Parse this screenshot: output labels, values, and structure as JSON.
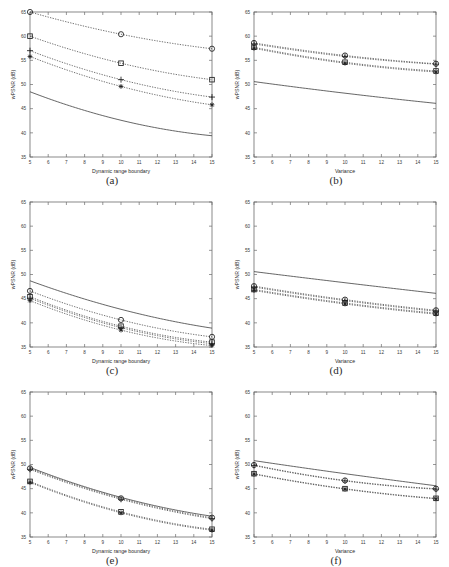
{
  "figure": {
    "background": "#ffffff",
    "ink": "#1a1a1a",
    "panel_count": 6
  },
  "chart_data": [
    {
      "type": "line",
      "panel": "(a)",
      "title": "",
      "xlabel": "Dynamic range boundary",
      "ylabel": "wPSNR (dB)",
      "x": [
        5,
        10,
        15
      ],
      "xlim": [
        5,
        15
      ],
      "ylim": [
        35,
        65
      ],
      "xticks": [
        5,
        6,
        7,
        8,
        9,
        10,
        11,
        12,
        13,
        14,
        15
      ],
      "yticks": [
        35,
        40,
        45,
        50,
        55,
        60,
        65
      ],
      "grid": false,
      "legend": "none",
      "series": [
        {
          "name": "circle",
          "marker": "o",
          "style": "dotted",
          "values": [
            65.0,
            60.4,
            57.4
          ]
        },
        {
          "name": "square",
          "marker": "s",
          "style": "dotted",
          "values": [
            60.0,
            54.4,
            51.0
          ]
        },
        {
          "name": "plus",
          "marker": "+",
          "style": "dotted",
          "values": [
            57.0,
            51.0,
            47.4
          ]
        },
        {
          "name": "asterisk",
          "marker": "*",
          "style": "dotted",
          "values": [
            55.8,
            49.6,
            45.8
          ]
        },
        {
          "name": "solid",
          "marker": "none",
          "style": "solid",
          "values": [
            48.5,
            42.6,
            39.4
          ]
        }
      ]
    },
    {
      "type": "line",
      "panel": "(b)",
      "title": "",
      "xlabel": "Variance",
      "ylabel": "wPSNR (dB)",
      "x": [
        5,
        10,
        15
      ],
      "xlim": [
        5,
        15
      ],
      "ylim": [
        35,
        65
      ],
      "xticks": [
        5,
        6,
        7,
        8,
        9,
        10,
        11,
        12,
        13,
        14,
        15
      ],
      "yticks": [
        35,
        40,
        45,
        50,
        55,
        60,
        65
      ],
      "grid": false,
      "legend": "none",
      "series": [
        {
          "name": "circle",
          "marker": "o",
          "style": "dotted",
          "values": [
            58.6,
            56.0,
            54.3
          ]
        },
        {
          "name": "plus",
          "marker": "+",
          "style": "dotted",
          "values": [
            58.4,
            55.8,
            54.2
          ]
        },
        {
          "name": "square",
          "marker": "s",
          "style": "dotted",
          "values": [
            57.7,
            54.6,
            52.8
          ]
        },
        {
          "name": "asterisk",
          "marker": "*",
          "style": "dotted",
          "values": [
            57.5,
            54.4,
            52.6
          ]
        },
        {
          "name": "solid",
          "marker": "none",
          "style": "solid",
          "values": [
            50.6,
            48.2,
            46.1
          ]
        }
      ]
    },
    {
      "type": "line",
      "panel": "(c)",
      "title": "",
      "xlabel": "Dynamic range boundary",
      "ylabel": "wPSNR (dB)",
      "x": [
        5,
        10,
        15
      ],
      "xlim": [
        5,
        15
      ],
      "ylim": [
        35,
        65
      ],
      "xticks": [
        5,
        6,
        7,
        8,
        9,
        10,
        11,
        12,
        13,
        14,
        15
      ],
      "yticks": [
        35,
        40,
        45,
        50,
        55,
        60,
        65
      ],
      "grid": false,
      "legend": "none",
      "series": [
        {
          "name": "solid",
          "marker": "none",
          "style": "solid",
          "values": [
            48.7,
            42.8,
            38.9
          ]
        },
        {
          "name": "circle",
          "marker": "o",
          "style": "dotted",
          "values": [
            46.6,
            40.6,
            37.1
          ]
        },
        {
          "name": "square",
          "marker": "s",
          "style": "dotted",
          "values": [
            45.4,
            39.3,
            36.0
          ]
        },
        {
          "name": "plus",
          "marker": "+",
          "style": "dotted",
          "values": [
            45.1,
            39.0,
            35.7
          ]
        },
        {
          "name": "asterisk",
          "marker": "*",
          "style": "dotted",
          "values": [
            44.6,
            38.5,
            35.3
          ]
        }
      ]
    },
    {
      "type": "line",
      "panel": "(d)",
      "title": "",
      "xlabel": "Variance",
      "ylabel": "wPSNR (dB)",
      "x": [
        5,
        10,
        15
      ],
      "xlim": [
        5,
        15
      ],
      "ylim": [
        35,
        65
      ],
      "xticks": [
        5,
        6,
        7,
        8,
        9,
        10,
        11,
        12,
        13,
        14,
        15
      ],
      "yticks": [
        35,
        40,
        45,
        50,
        55,
        60,
        65
      ],
      "grid": false,
      "legend": "none",
      "series": [
        {
          "name": "solid",
          "marker": "none",
          "style": "solid",
          "values": [
            50.6,
            48.3,
            46.1
          ]
        },
        {
          "name": "circle",
          "marker": "o",
          "style": "dotted",
          "values": [
            47.6,
            44.8,
            42.6
          ]
        },
        {
          "name": "plus",
          "marker": "+",
          "style": "dotted",
          "values": [
            47.4,
            44.6,
            42.4
          ]
        },
        {
          "name": "square",
          "marker": "s",
          "style": "dotted",
          "values": [
            46.9,
            44.1,
            42.0
          ]
        },
        {
          "name": "asterisk",
          "marker": "*",
          "style": "dotted",
          "values": [
            46.7,
            43.9,
            41.8
          ]
        }
      ]
    },
    {
      "type": "line",
      "panel": "(e)",
      "title": "",
      "xlabel": "Dynamic range boundary",
      "ylabel": "wPSNR (dB)",
      "x": [
        5,
        10,
        15
      ],
      "xlim": [
        5,
        15
      ],
      "ylim": [
        35,
        65
      ],
      "xticks": [
        5,
        6,
        7,
        8,
        9,
        10,
        11,
        12,
        13,
        14,
        15
      ],
      "yticks": [
        35,
        40,
        45,
        50,
        55,
        60,
        65
      ],
      "grid": false,
      "legend": "none",
      "series": [
        {
          "name": "solid",
          "marker": "none",
          "style": "solid",
          "values": [
            49.4,
            43.2,
            39.3
          ]
        },
        {
          "name": "circle",
          "marker": "o",
          "style": "dotted",
          "values": [
            49.2,
            43.0,
            39.0
          ]
        },
        {
          "name": "plus",
          "marker": "+",
          "style": "dotted",
          "values": [
            49.0,
            42.8,
            38.8
          ]
        },
        {
          "name": "square",
          "marker": "s",
          "style": "dotted",
          "values": [
            46.5,
            40.2,
            36.6
          ]
        },
        {
          "name": "asterisk",
          "marker": "*",
          "style": "dotted",
          "values": [
            46.3,
            40.0,
            36.4
          ]
        }
      ]
    },
    {
      "type": "line",
      "panel": "(f)",
      "title": "",
      "xlabel": "Variance",
      "ylabel": "wPSNR (dB)",
      "x": [
        5,
        10,
        15
      ],
      "xlim": [
        5,
        15
      ],
      "ylim": [
        35,
        65
      ],
      "xticks": [
        5,
        6,
        7,
        8,
        9,
        10,
        11,
        12,
        13,
        14,
        15
      ],
      "yticks": [
        35,
        40,
        45,
        50,
        55,
        60,
        65
      ],
      "grid": false,
      "legend": "none",
      "series": [
        {
          "name": "solid",
          "marker": "none",
          "style": "solid",
          "values": [
            50.8,
            48.1,
            45.6
          ]
        },
        {
          "name": "circle",
          "marker": "o",
          "style": "dotted",
          "values": [
            49.9,
            46.7,
            45.0
          ]
        },
        {
          "name": "plus",
          "marker": "+",
          "style": "dotted",
          "values": [
            49.8,
            46.6,
            44.9
          ]
        },
        {
          "name": "square",
          "marker": "s",
          "style": "dotted",
          "values": [
            48.1,
            45.0,
            43.0
          ]
        },
        {
          "name": "asterisk",
          "marker": "*",
          "style": "dotted",
          "values": [
            48.0,
            44.9,
            42.9
          ]
        }
      ]
    }
  ],
  "panels": [
    {
      "caption": "(a)",
      "left": 0,
      "top": 2
    },
    {
      "caption": "(b)",
      "left": 224,
      "top": 2
    },
    {
      "caption": "(c)",
      "left": 0,
      "top": 192
    },
    {
      "caption": "(d)",
      "left": 224,
      "top": 192
    },
    {
      "caption": "(e)",
      "left": 0,
      "top": 382
    },
    {
      "caption": "(f)",
      "left": 224,
      "top": 382
    }
  ]
}
